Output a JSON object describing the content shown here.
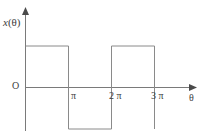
{
  "chart_data": {
    "type": "line",
    "title": "",
    "subtitle": "",
    "xlabel": "θ",
    "ylabel": "x(θ)",
    "origin_label": "O",
    "grid": false,
    "legend": null,
    "waveform": "square wave",
    "period_label": "2π",
    "amplitude": 1,
    "xlim": [
      0,
      3.4
    ],
    "ylim": [
      -1.3,
      1.3
    ],
    "x_tick_labels": [
      "π",
      "2 π",
      "3 π"
    ],
    "x_tick_values": [
      1,
      2,
      3
    ],
    "x_tick_unit": "π",
    "y_tick_labels": [],
    "series": [
      {
        "name": "x(θ)",
        "x": [
          0,
          1,
          1,
          2,
          2,
          3,
          3
        ],
        "values": [
          1,
          1,
          -1,
          -1,
          1,
          1,
          -1
        ]
      }
    ],
    "axis_arrow_x": true,
    "axis_arrow_y": true,
    "line_color": "#8a8a8a",
    "axis_color": "#6e6e6e",
    "text_color": "#3d3d3d",
    "background_color": "#ffffff"
  },
  "labels": {
    "y_axis": "x(θ)",
    "y_axis_var": "x",
    "y_axis_arg": "(θ)",
    "origin": "O",
    "tick_pi": "π",
    "tick_2pi": "2 π",
    "tick_3pi": "3 π",
    "x_axis": "θ"
  }
}
